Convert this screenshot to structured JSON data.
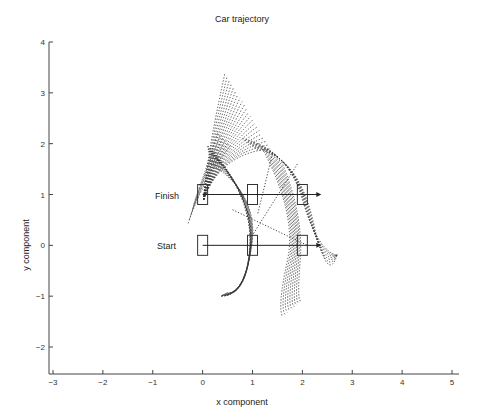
{
  "chart_data": {
    "type": "line",
    "title": "Car trajectory",
    "xlabel": "x component",
    "ylabel": "y component",
    "xlim": [
      -3,
      5
    ],
    "ylim": [
      -2.5,
      4
    ],
    "xticks": [
      -3,
      -2,
      -1,
      0,
      1,
      2,
      3,
      4,
      5
    ],
    "yticks": [
      -2,
      -1,
      0,
      1,
      2,
      3,
      4
    ],
    "grid": false,
    "legend": null,
    "annotations": [
      {
        "text": "Finish",
        "x": -0.5,
        "y": 1
      },
      {
        "text": "Start",
        "x": -0.5,
        "y": 0
      }
    ],
    "cars": {
      "start": [
        {
          "x": 0,
          "y": 0
        },
        {
          "x": 1,
          "y": 0
        },
        {
          "x": 2,
          "y": 0
        }
      ],
      "finish": [
        {
          "x": 0,
          "y": 1
        },
        {
          "x": 1,
          "y": 1
        },
        {
          "x": 2,
          "y": 1
        }
      ],
      "arrows": [
        {
          "from": [
            0,
            0
          ],
          "to": [
            2.3,
            0
          ]
        },
        {
          "from": [
            0,
            1
          ],
          "to": [
            2.3,
            1
          ]
        }
      ]
    },
    "trajectory_envelope": {
      "peak": {
        "x": 0.45,
        "y": 3.4
      },
      "lower_left_end": {
        "x": 0.35,
        "y": -1.0
      },
      "lower_right_end": {
        "x": 1.7,
        "y": -1.4
      },
      "right_end": {
        "x": 2.7,
        "y": -0.2
      }
    }
  },
  "labels": {
    "title": "Car trajectory",
    "xlabel": "x component",
    "ylabel": "y component",
    "finish": "Finish",
    "start": "Start"
  }
}
